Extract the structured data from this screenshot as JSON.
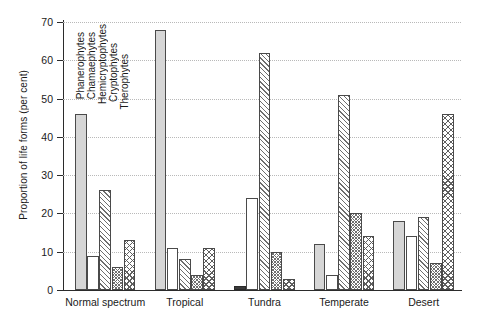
{
  "chart_data": {
    "type": "bar",
    "title": "",
    "xlabel": "",
    "ylabel": "Proportion of life forms (per cent)",
    "ylim": [
      0,
      70
    ],
    "yticks": [
      0,
      10,
      20,
      30,
      40,
      50,
      60,
      70
    ],
    "grid": true,
    "legend_position": "inside-upper-left",
    "categories": [
      "Normal spectrum",
      "Tropical",
      "Tundra",
      "Temperate",
      "Desert"
    ],
    "series": [
      {
        "name": "Phanerophytes",
        "values": [
          46,
          68,
          1,
          12,
          18
        ]
      },
      {
        "name": "Chamaephytes",
        "values": [
          9,
          11,
          24,
          4,
          14
        ]
      },
      {
        "name": "Hemicryptophytes",
        "values": [
          26,
          8,
          62,
          51,
          19
        ]
      },
      {
        "name": "Cryptophytes",
        "values": [
          6,
          4,
          10,
          20,
          7
        ]
      },
      {
        "name": "Therophytes",
        "values": [
          13,
          11,
          3,
          14,
          46
        ]
      }
    ]
  },
  "legend": {
    "items": [
      {
        "label": "Phanerophytes"
      },
      {
        "label": "Chamaephytes"
      },
      {
        "label": "Hemicryptophytes"
      },
      {
        "label": "Cryptophytes"
      },
      {
        "label": "Therophytes"
      }
    ]
  }
}
